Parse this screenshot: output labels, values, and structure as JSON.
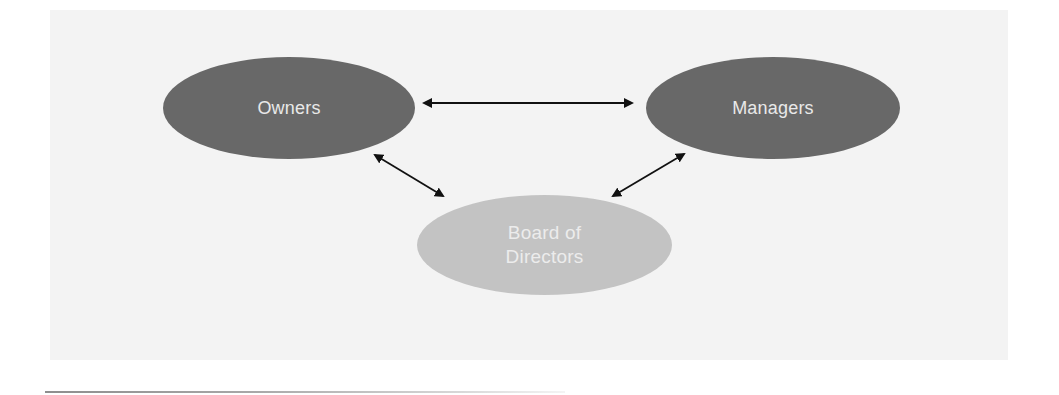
{
  "diagram": {
    "type": "relationship-diagram",
    "background_color": "#f3f3f3",
    "nodes": [
      {
        "id": "owners",
        "label": "Owners",
        "fill": "#686868",
        "text_color": "#e9e9e9"
      },
      {
        "id": "managers",
        "label": "Managers",
        "fill": "#686868",
        "text_color": "#e9e9e9"
      },
      {
        "id": "board",
        "label": "Board of\nDirectors",
        "fill": "#c3c3c3",
        "text_color": "#ececec"
      }
    ],
    "edges": [
      {
        "from": "owners",
        "to": "managers",
        "direction": "bidirectional"
      },
      {
        "from": "owners",
        "to": "board",
        "direction": "bidirectional"
      },
      {
        "from": "managers",
        "to": "board",
        "direction": "bidirectional"
      }
    ],
    "arrow_color": "#111111"
  }
}
